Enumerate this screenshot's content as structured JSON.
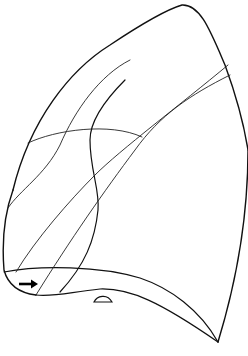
{
  "diagram": {
    "stroke_color": "#111111",
    "background": "#ffffff",
    "annotations": [
      {
        "type": "arrow",
        "direction": "right",
        "icon": "arrow-right-icon"
      }
    ],
    "labels": []
  }
}
